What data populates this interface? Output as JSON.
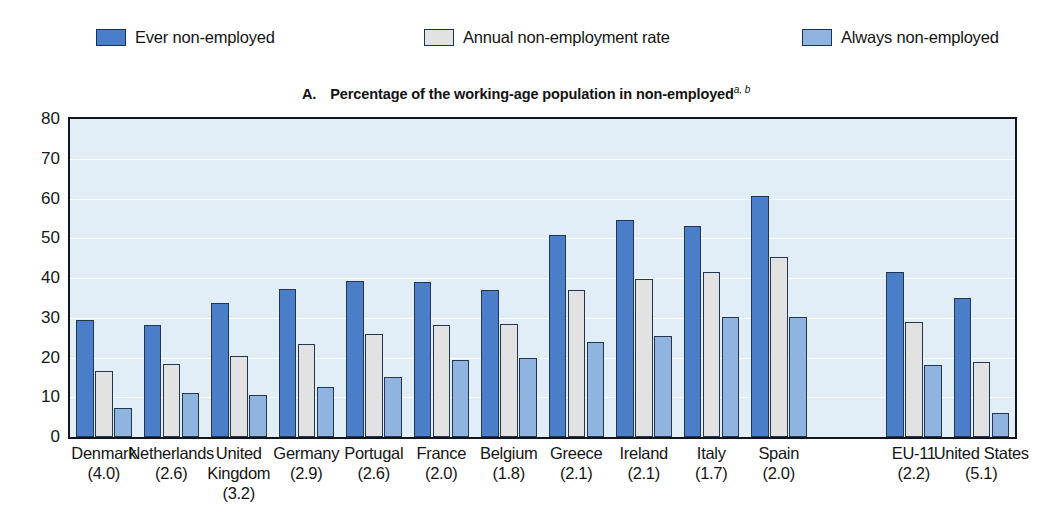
{
  "legend": {
    "items": [
      {
        "label": "Ever non-employed",
        "color": "#4a7ec8",
        "swatch_name": "legend-swatch-ever-non-employed"
      },
      {
        "label": "Annual non-employment rate",
        "color": "#e2e2e2",
        "swatch_name": "legend-swatch-annual-non-employment-rate"
      },
      {
        "label": "Always non-employed",
        "color": "#8fb4e0",
        "swatch_name": "legend-swatch-always-non-employed"
      }
    ]
  },
  "panel": {
    "letter": "A.",
    "title": "Percentage of the working-age population in non-employed",
    "footnote_marks": "a, b"
  },
  "chart_data": {
    "type": "bar",
    "xlabel": "",
    "ylabel": "",
    "ylim": [
      0,
      80
    ],
    "yticks": [
      0,
      10,
      20,
      30,
      40,
      50,
      60,
      70,
      80
    ],
    "grid": true,
    "legend_position": "top",
    "categories": [
      "Denmark",
      "Netherlands",
      "United Kingdom",
      "Germany",
      "Portugal",
      "France",
      "Belgium",
      "Greece",
      "Ireland",
      "Italy",
      "Spain",
      "EU-11",
      "United States"
    ],
    "category_values": [
      "(4.0)",
      "(2.6)",
      "(3.2)",
      "(2.9)",
      "(2.6)",
      "(2.0)",
      "(1.8)",
      "(2.1)",
      "(2.1)",
      "(1.7)",
      "(2.0)",
      "(2.2)",
      "(5.1)"
    ],
    "category_gap_before": [
      false,
      false,
      false,
      false,
      false,
      false,
      false,
      false,
      false,
      false,
      false,
      true,
      false
    ],
    "series": [
      {
        "name": "Ever non-employed",
        "color": "#4a7ec8",
        "values": [
          29.5,
          28.3,
          33.6,
          37.2,
          39.2,
          39.0,
          37.0,
          50.9,
          54.6,
          53.2,
          60.7,
          41.5,
          35.0
        ]
      },
      {
        "name": "Annual non-employment rate",
        "color": "#e2e2e2",
        "values": [
          16.6,
          18.4,
          20.5,
          23.4,
          25.8,
          28.2,
          28.4,
          37.0,
          39.7,
          41.4,
          45.4,
          29.0,
          18.8
        ]
      },
      {
        "name": "Always non-employed",
        "color": "#8fb4e0",
        "values": [
          7.4,
          11.0,
          10.5,
          12.7,
          15.2,
          19.3,
          20.0,
          23.9,
          25.4,
          30.3,
          30.2,
          18.2,
          6.0
        ]
      }
    ]
  }
}
